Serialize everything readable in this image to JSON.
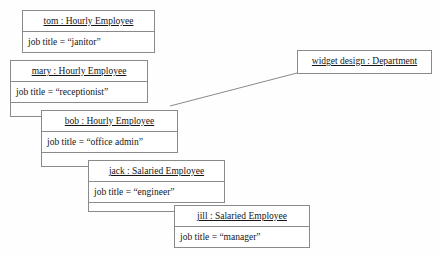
{
  "diagram": {
    "background_color": "#fefefe",
    "line_color": "#8a8a8a",
    "text_color": "#161616",
    "objects": [
      {
        "id": "tom",
        "instance_name": "tom",
        "class_name": "Hourly Employee",
        "header": "tom : Hourly Employee",
        "attribute": "job title = “janitor”",
        "attribute_key": "job title",
        "attribute_value": "“janitor”",
        "compartments": 2,
        "x": 22,
        "y": 10,
        "width": 133,
        "height": 43,
        "z": 1
      },
      {
        "id": "mary",
        "instance_name": "mary",
        "class_name": "Hourly Employee",
        "header": "mary : Hourly Employee",
        "attribute": "job title = “receptionist”",
        "attribute_key": "job title",
        "attribute_value": "“receptionist”",
        "compartments": 2,
        "x": 10,
        "y": 60,
        "width": 138,
        "height": 43,
        "z": 2
      },
      {
        "id": "bob",
        "instance_name": "bob",
        "class_name": "Hourly Employee",
        "header": "bob : Hourly Employee",
        "attribute": "job title = “office admin”",
        "attribute_key": "job title",
        "attribute_value": "“office admin”",
        "compartments": 2,
        "x": 41,
        "y": 110,
        "width": 137,
        "height": 43,
        "z": 3
      },
      {
        "id": "jack",
        "instance_name": "jack",
        "class_name": "Salaried Employee",
        "header": "jack : Salaried Employee",
        "attribute": "job title = “engineer”",
        "attribute_key": "job title",
        "attribute_value": "“engineer”",
        "compartments": 2,
        "x": 88,
        "y": 160,
        "width": 137,
        "height": 43,
        "z": 4
      },
      {
        "id": "jill",
        "instance_name": "jill",
        "class_name": "Salaried Employee",
        "header": "jill : Salaried Employee",
        "attribute": "job title = “manager”",
        "attribute_key": "job title",
        "attribute_value": "“manager”",
        "compartments": 2,
        "x": 174,
        "y": 205,
        "width": 136,
        "height": 43,
        "z": 5
      },
      {
        "id": "department",
        "instance_name": "widget design",
        "class_name": "Department",
        "header": "widget design : Department",
        "attribute": "",
        "compartments": 1,
        "x": 297,
        "y": 50,
        "width": 135,
        "height": 24,
        "z": 6
      }
    ],
    "links": [
      {
        "id": "link-bob-department",
        "kind": "diagonal",
        "x1": 170,
        "y1": 106,
        "x2": 297,
        "y2": 73
      },
      {
        "id": "link-mary-stub-vertical",
        "kind": "orthogonal",
        "x1": 10,
        "y1": 103,
        "x2": 10,
        "y2": 116
      },
      {
        "id": "link-mary-stub-horizontal",
        "kind": "orthogonal",
        "x1": 10,
        "y1": 116,
        "x2": 41,
        "y2": 116
      },
      {
        "id": "link-bob-stub-vertical",
        "kind": "orthogonal",
        "x1": 41,
        "y1": 153,
        "x2": 41,
        "y2": 166
      },
      {
        "id": "link-bob-stub-horizontal",
        "kind": "orthogonal",
        "x1": 41,
        "y1": 166,
        "x2": 88,
        "y2": 166
      },
      {
        "id": "link-jack-stub-vertical",
        "kind": "orthogonal",
        "x1": 88,
        "y1": 203,
        "x2": 88,
        "y2": 211
      },
      {
        "id": "link-jack-stub-horizontal",
        "kind": "orthogonal",
        "x1": 88,
        "y1": 211,
        "x2": 174,
        "y2": 211
      }
    ]
  }
}
